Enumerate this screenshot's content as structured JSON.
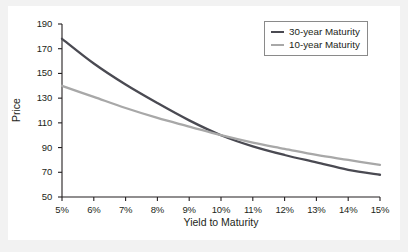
{
  "figure": {
    "background_color": "#f2f2f2",
    "panel_color": "#ffffff"
  },
  "chart_data": {
    "type": "line",
    "title": "",
    "xlabel": "Yield to Maturity",
    "ylabel": "Price",
    "xlim": [
      5,
      15
    ],
    "ylim": [
      50,
      190
    ],
    "grid": false,
    "legend_position": "upper-right",
    "xticks": [
      "5%",
      "6%",
      "7%",
      "8%",
      "9%",
      "10%",
      "11%",
      "12%",
      "13%",
      "14%",
      "15%"
    ],
    "xtick_values": [
      5,
      6,
      7,
      8,
      9,
      10,
      11,
      12,
      13,
      14,
      15
    ],
    "yticks": [
      "50",
      "70",
      "90",
      "110",
      "130",
      "150",
      "170",
      "190"
    ],
    "ytick_values": [
      50,
      70,
      90,
      110,
      130,
      150,
      170,
      190
    ],
    "x": [
      5,
      6,
      7,
      8,
      9,
      10,
      11,
      12,
      13,
      14,
      15
    ],
    "series": [
      {
        "name": "30-year Maturity",
        "color": "#4a4a52",
        "values": [
          178,
          158,
          141,
          126,
          112,
          100,
          91,
          84,
          78,
          72,
          68
        ]
      },
      {
        "name": "10-year Maturity",
        "color": "#a8a8a8",
        "values": [
          140,
          131,
          122,
          114,
          107,
          100,
          94,
          89,
          84,
          80,
          76
        ]
      }
    ]
  },
  "legend": {
    "entries": [
      {
        "label": "30-year Maturity",
        "color": "#4a4a52"
      },
      {
        "label": "10-year Maturity",
        "color": "#a8a8a8"
      }
    ]
  }
}
